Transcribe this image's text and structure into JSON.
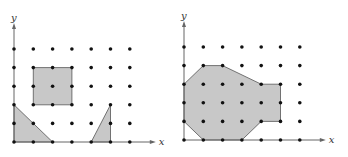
{
  "figures": [
    {
      "id": "left",
      "origin_px": [
        14,
        142
      ],
      "x_spacing": 19.3,
      "y_spacing": 18.6,
      "x_max": 6,
      "y_max": 5,
      "axis_labels": {
        "x": "x",
        "y": "y"
      },
      "shapes": [
        {
          "name": "square",
          "points": [
            [
              1,
              2
            ],
            [
              3,
              2
            ],
            [
              3,
              4
            ],
            [
              1,
              4
            ]
          ]
        },
        {
          "name": "left-triangle",
          "points": [
            [
              0,
              0
            ],
            [
              0,
              2
            ],
            [
              2,
              0
            ]
          ]
        },
        {
          "name": "right-triangle",
          "points": [
            [
              4,
              0
            ],
            [
              5,
              2
            ],
            [
              5,
              0
            ]
          ]
        }
      ]
    },
    {
      "id": "right",
      "origin_px": [
        184,
        140
      ],
      "x_spacing": 19.3,
      "y_spacing": 18.6,
      "x_max": 6,
      "y_max": 5,
      "axis_labels": {
        "x": "x",
        "y": "y"
      },
      "shapes": [
        {
          "name": "octagon-region",
          "points": [
            [
              0,
              1
            ],
            [
              1,
              0
            ],
            [
              3,
              0
            ],
            [
              4,
              1
            ],
            [
              5,
              1
            ],
            [
              5,
              3
            ],
            [
              4,
              3
            ],
            [
              2,
              4
            ],
            [
              1,
              4
            ],
            [
              0,
              3
            ]
          ]
        }
      ]
    }
  ],
  "colors": {
    "fill": "#c8c8c8",
    "stroke": "#555555",
    "dot": "#111111",
    "axis": "#666666"
  }
}
